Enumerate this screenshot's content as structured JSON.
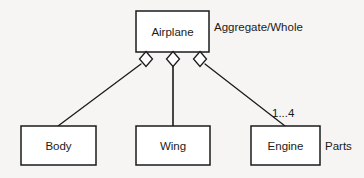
{
  "diagram": {
    "type": "uml-aggregation-class-diagram",
    "background_color": "#f6f5f3",
    "stroke_color": "#1b1b1b",
    "box_fill_color": "#ffffff",
    "whole": {
      "name": "airplane-class-box",
      "label": "Airplane",
      "x": 136,
      "y": 11,
      "width": 73,
      "height": 41
    },
    "whole_annotation": {
      "name": "aggregate-whole-label",
      "label": "Aggregate/Whole",
      "x": 214,
      "y": 27
    },
    "parts": [
      {
        "name": "body-class-box",
        "label": "Body",
        "x": 21,
        "y": 126,
        "width": 75,
        "height": 39
      },
      {
        "name": "wing-class-box",
        "label": "Wing",
        "x": 136,
        "y": 126,
        "width": 74,
        "height": 39
      },
      {
        "name": "engine-class-box",
        "label": "Engine",
        "x": 251,
        "y": 126,
        "width": 69,
        "height": 39
      }
    ],
    "parts_annotation": {
      "name": "parts-label",
      "label": "Parts",
      "x": 325,
      "y": 146
    },
    "associations": [
      {
        "name": "airplane-body-aggregation",
        "from": "Airplane",
        "to": "Body",
        "diamond_cx": 146,
        "diamond_cy": 59,
        "diamond_rx": 6.5,
        "diamond_ry": 7.5,
        "line_x1": 141,
        "line_y1": 64,
        "line_x2": 58,
        "line_y2": 126,
        "multiplicity": ""
      },
      {
        "name": "airplane-wing-aggregation",
        "from": "Airplane",
        "to": "Wing",
        "diamond_cx": 173,
        "diamond_cy": 59,
        "diamond_rx": 6.5,
        "diamond_ry": 7.5,
        "line_x1": 173,
        "line_y1": 67,
        "line_x2": 173,
        "line_y2": 126,
        "multiplicity": ""
      },
      {
        "name": "airplane-engine-aggregation",
        "from": "Airplane",
        "to": "Engine",
        "diamond_cx": 200,
        "diamond_cy": 59,
        "diamond_rx": 6.5,
        "diamond_ry": 7.5,
        "line_x1": 205,
        "line_y1": 64,
        "line_x2": 285,
        "line_y2": 126,
        "multiplicity": "1...4",
        "multiplicity_x": 272,
        "multiplicity_y": 113
      }
    ]
  }
}
